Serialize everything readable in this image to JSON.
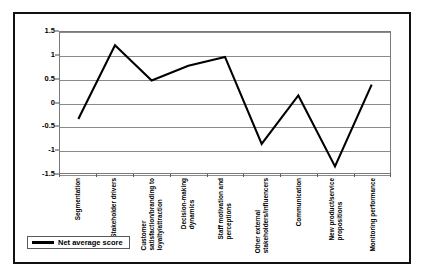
{
  "chart_data": {
    "type": "line",
    "title": "",
    "xlabel": "",
    "ylabel": "",
    "ylim": [
      -1.5,
      1.5
    ],
    "yticks": [
      1.5,
      1,
      0.5,
      0,
      -0.5,
      -1,
      -1.5
    ],
    "ytick_labels": [
      "1.5",
      "1",
      "0.5",
      "0",
      "-0.5",
      "-1",
      "-1.5"
    ],
    "grid": true,
    "legend_position": "bottom-left",
    "categories": [
      "Segmentation",
      "Stakeholder drivers",
      "Customer satisfaction/branding to loyalty/attraction",
      "Decision-making dynamics",
      "Staff motivation and perceptions",
      "Other external stakeholders/influencers",
      "Communication",
      "New product/service propositions",
      "Monitoring performance"
    ],
    "category_lines": [
      [
        "Segmentation"
      ],
      [
        "Stakeholder drivers"
      ],
      [
        "Customer",
        "satisfaction/branding to",
        "loyalty/attraction"
      ],
      [
        "Decision-making",
        "dynamics"
      ],
      [
        "Staff motivation and",
        "perceptions"
      ],
      [
        "Other external",
        "stakeholders/influencers"
      ],
      [
        "Communication"
      ],
      [
        "New product/service",
        "propositions"
      ],
      [
        "Monitoring performance"
      ]
    ],
    "series": [
      {
        "name": "Net average score",
        "color": "#000000",
        "values": [
          -0.35,
          1.22,
          0.47,
          0.78,
          0.97,
          -0.88,
          0.15,
          -1.36,
          0.38
        ]
      }
    ]
  },
  "legend": {
    "label": "Net average score"
  }
}
